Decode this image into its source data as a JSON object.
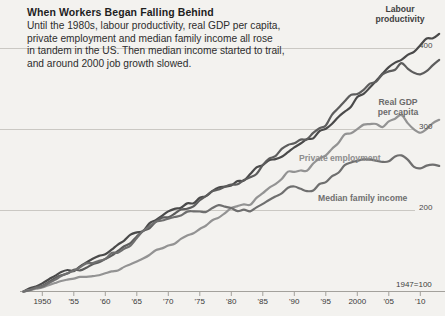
{
  "header": {
    "title": "When Workers Began Falling Behind",
    "subtitle": "Until the 1980s, labour productivity, real GDP per capita,\nprivate employment and median family income all rose\nin tandem in the US. Then median income started to trail,\nand around 2000 job growth slowed."
  },
  "annotations": {
    "labour_productivity": "Labour\nproductivity",
    "real_gdp_per_capita": "Real GDP\nper capita",
    "private_employment": "Private employment",
    "median_family_income": "Median family income",
    "base_note": "1947=100"
  },
  "axis": {
    "y_ticks": [
      "400",
      "300",
      "200"
    ],
    "x_ticks": [
      "1950",
      "'55",
      "'60",
      "'65",
      "'70",
      "'75",
      "'80",
      "'85",
      "'90",
      "'95",
      "2000",
      "'05",
      "'10"
    ]
  },
  "colors": {
    "background": "#f3f2ef",
    "gridline": "#c9c7c2",
    "axis": "#9e9c97",
    "labour_productivity": "#4a4a4a",
    "real_gdp_per_capita": "#5d5d5d",
    "private_employment": "#939393",
    "median_family_income": "#6f6f6f"
  },
  "chart_data": {
    "type": "line",
    "title": "When Workers Began Falling Behind",
    "subtitle": "Until the 1980s, labour productivity, real GDP per capita, private employment and median family income all rose in tandem in the US. Then median income started to trail, and around 2000 job growth slowed.",
    "xlabel": "",
    "ylabel": "",
    "base_note": "1947=100",
    "grid": true,
    "legend": "inline-annotations",
    "xlim": [
      1947,
      2013
    ],
    "ylim": [
      100,
      440
    ],
    "x_tick_values": [
      1950,
      1955,
      1960,
      1965,
      1970,
      1975,
      1980,
      1985,
      1990,
      1995,
      2000,
      2005,
      2010
    ],
    "y_tick_values": [
      200,
      300,
      400
    ],
    "x": [
      1947,
      1950,
      1953,
      1956,
      1959,
      1962,
      1965,
      1968,
      1971,
      1974,
      1977,
      1980,
      1983,
      1986,
      1989,
      1992,
      1995,
      1998,
      2001,
      2004,
      2007,
      2010,
      2013
    ],
    "series": [
      {
        "name": "Labour productivity",
        "color": "#4a4a4a",
        "values": [
          100,
          110,
          124,
          131,
          144,
          158,
          173,
          188,
          202,
          209,
          224,
          231,
          245,
          262,
          272,
          288,
          301,
          322,
          344,
          369,
          386,
          404,
          418
        ]
      },
      {
        "name": "Real GDP per capita",
        "color": "#5d5d5d",
        "values": [
          100,
          107,
          120,
          126,
          136,
          150,
          168,
          186,
          196,
          205,
          224,
          232,
          241,
          264,
          281,
          288,
          305,
          335,
          349,
          368,
          382,
          368,
          386
        ]
      },
      {
        "name": "Private employment",
        "color": "#939393",
        "values": [
          100,
          105,
          113,
          118,
          120,
          126,
          137,
          151,
          159,
          172,
          188,
          203,
          207,
          228,
          248,
          249,
          268,
          294,
          306,
          303,
          318,
          296,
          312
        ]
      },
      {
        "name": "Median family income",
        "color": "#6f6f6f",
        "values": [
          100,
          106,
          119,
          130,
          138,
          148,
          166,
          186,
          192,
          199,
          203,
          203,
          199,
          213,
          228,
          224,
          235,
          256,
          263,
          260,
          268,
          252,
          255
        ]
      }
    ]
  }
}
